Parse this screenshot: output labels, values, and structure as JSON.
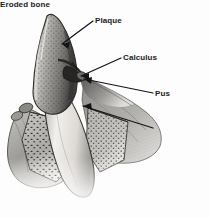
{
  "figure": {
    "type": "grayscale medical line-and-wash illustration",
    "background_color": "#fdfdfd",
    "ink_color": "#1b1b1b"
  },
  "callouts": [
    {
      "id": "plaque",
      "label": "Plaque",
      "label_x": 95,
      "label_y": 16,
      "leader": {
        "x1": 93,
        "y1": 21,
        "x2": 62,
        "y2": 44
      },
      "arrow": true
    },
    {
      "id": "calculus",
      "label": "Calculus",
      "label_x": 123,
      "label_y": 53,
      "leader": {
        "x1": 121,
        "y1": 58,
        "x2": 81,
        "y2": 76
      },
      "arrow": true
    },
    {
      "id": "pus",
      "label": "Pus",
      "label_x": 155,
      "label_y": 89,
      "leader": {
        "x1": 153,
        "y1": 93,
        "x2": 84,
        "y2": 79
      },
      "arrow": true
    },
    {
      "id": "eroded-bone",
      "label": "Eroded bone",
      "label_x": 155,
      "label_y": 124,
      "leader": {
        "x1": 153,
        "y1": 128,
        "x2": 83,
        "y2": 106
      },
      "arrow": true
    }
  ],
  "anatomy": [
    {
      "id": "tooth-crown",
      "name": "tooth crown with plaque coating",
      "tone": "#8d8d8d"
    },
    {
      "id": "tooth-root",
      "name": "tooth root",
      "tone": "#e6e4e0"
    },
    {
      "id": "calculus-deposit",
      "name": "calculus deposit at gumline",
      "tone": "#2e2e2e"
    },
    {
      "id": "gum-left",
      "name": "left gum tissue flap",
      "tone": "#a8a6a3"
    },
    {
      "id": "gum-right",
      "name": "right gum tissue flap",
      "tone": "#9b9996"
    },
    {
      "id": "bone-left",
      "name": "eroded alveolar bone (left)",
      "tone": "#b4b2ae"
    },
    {
      "id": "bone-right",
      "name": "eroded alveolar bone (right)",
      "tone": "#a9a7a3"
    },
    {
      "id": "pus-pocket",
      "name": "periodontal pocket with pus",
      "tone": "#6f6d6a"
    }
  ]
}
